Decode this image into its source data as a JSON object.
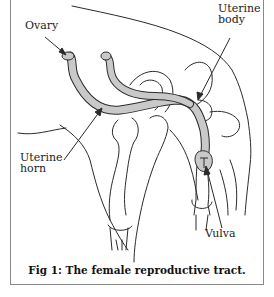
{
  "figure": {
    "caption": "Fig 1: The female reproductive tract.",
    "labels": {
      "ovary": "Ovary",
      "uterine_body_line1": "Uterine",
      "uterine_body_line2": "body",
      "uterine_horn_line1": "Uterine",
      "uterine_horn_line2": "horn",
      "vulva": "Vulva"
    },
    "colors": {
      "line": "#2a2a2a",
      "tract_fill": "#c9c9c9",
      "frame": "#8a8a8a"
    }
  }
}
